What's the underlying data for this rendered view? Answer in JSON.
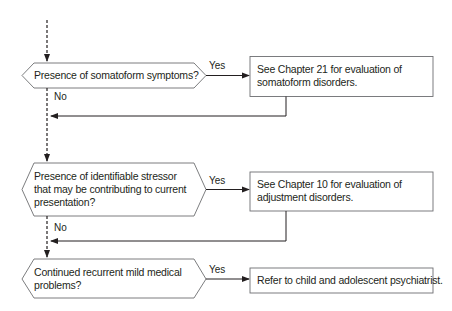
{
  "flowchart": {
    "decisions": [
      {
        "id": "q1",
        "lines": [
          "Presence of somatoform symptoms?"
        ]
      },
      {
        "id": "q2",
        "lines": [
          "Presence of identifiable stressor",
          "that may be contributing to current",
          "presentation?"
        ]
      },
      {
        "id": "q3",
        "lines": [
          "Continued recurrent mild medical",
          "problems?"
        ]
      }
    ],
    "outcomes": [
      {
        "id": "r1",
        "lines": [
          "See Chapter 21 for evaluation of",
          "somatoform disorders."
        ]
      },
      {
        "id": "r2",
        "lines": [
          "See Chapter 10 for evaluation of",
          "adjustment disorders."
        ]
      },
      {
        "id": "r3",
        "lines": [
          "Refer to child and adolescent psychiatrist."
        ]
      }
    ],
    "edge_labels": {
      "yes1": "Yes",
      "no1": "No",
      "yes2": "Yes",
      "no2": "No",
      "yes3": "Yes"
    },
    "colors": {
      "line": "#231f20",
      "box_border": "#6d6e71",
      "background": "#ffffff"
    }
  }
}
